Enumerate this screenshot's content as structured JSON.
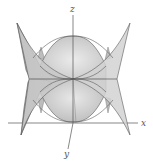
{
  "figure": {
    "type": "3d-surface-plot",
    "axes": {
      "x_label": "x",
      "y_label": "y",
      "z_label": "z"
    },
    "colors": {
      "surface_light": "#e4e4e4",
      "surface_mid": "#c9c9c9",
      "surface_dark": "#a9a9a9",
      "edge": "#5a5a5a",
      "axis": "#555555"
    }
  }
}
